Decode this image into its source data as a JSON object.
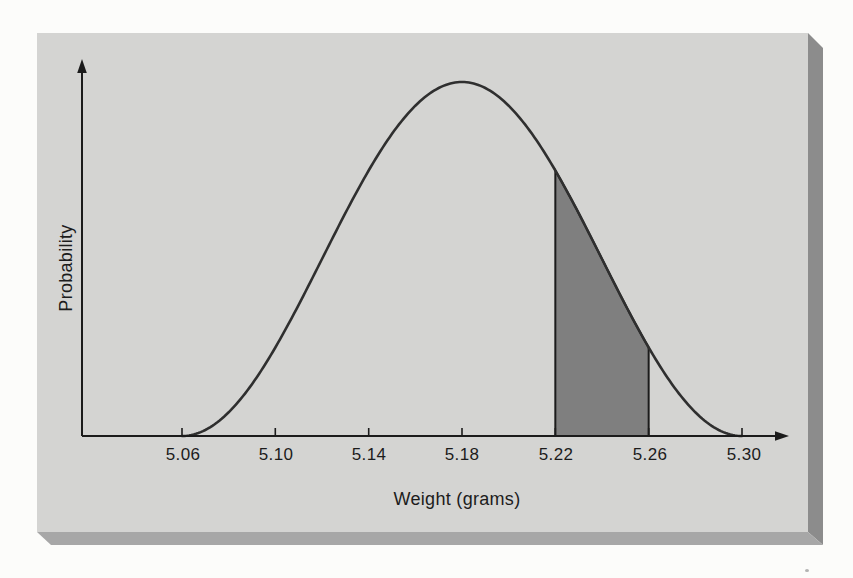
{
  "chart_data": {
    "type": "area",
    "title": "",
    "xlabel": "Weight (grams)",
    "ylabel": "Probability",
    "x_tick_labels": [
      "5.06",
      "5.10",
      "5.14",
      "5.18",
      "5.22",
      "5.26",
      "5.30"
    ],
    "x_tick_values": [
      5.06,
      5.1,
      5.14,
      5.18,
      5.22,
      5.26,
      5.3
    ],
    "x_domain": [
      5.06,
      5.3
    ],
    "curve": {
      "shape": "normal-bell",
      "mean": 5.18,
      "implied_sd": 0.04,
      "zero_at": [
        5.06,
        5.3
      ],
      "peak_x": 5.18
    },
    "shaded_region": {
      "from": 5.22,
      "to": 5.26
    },
    "y_axis": {
      "numeric_ticks": "none",
      "arrow": true
    },
    "x_axis": {
      "arrow": true
    },
    "grid": false,
    "legend": "none"
  },
  "colors": {
    "page_bg": "#fcfcfa",
    "panel_bg": "#d4d4d2",
    "panel_edge_right": "#8c8c8c",
    "panel_edge_bottom": "#a7a7a7",
    "curve_stroke": "#2f2f2f",
    "shade_fill": "#7f7f7f",
    "axis_color": "#1b1b1b",
    "text_color": "#1c1c1c"
  }
}
